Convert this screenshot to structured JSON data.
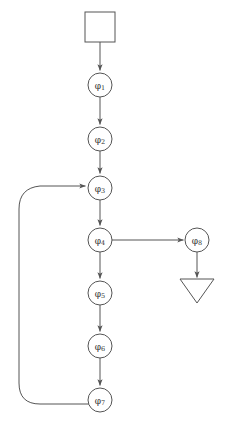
{
  "diagram": {
    "type": "flowchart",
    "background_color": "#ffffff",
    "stroke_color": "#555555",
    "label_color": "#333333",
    "nodes": [
      {
        "id": "start",
        "shape": "square",
        "label": "",
        "icon_name": "start-square-node",
        "x": 100,
        "y": 27,
        "size": 30
      },
      {
        "id": "phi1",
        "shape": "circle",
        "label": "φ",
        "subscript": "1",
        "icon_name": "state-circle-node",
        "x": 100,
        "y": 85,
        "r": 12
      },
      {
        "id": "phi2",
        "shape": "circle",
        "label": "φ",
        "subscript": "2",
        "icon_name": "state-circle-node",
        "x": 100,
        "y": 139,
        "r": 12
      },
      {
        "id": "phi3",
        "shape": "circle",
        "label": "φ",
        "subscript": "3",
        "icon_name": "state-circle-node",
        "x": 100,
        "y": 188,
        "r": 12
      },
      {
        "id": "phi4",
        "shape": "circle",
        "label": "φ",
        "subscript": "4",
        "icon_name": "state-circle-node",
        "x": 100,
        "y": 240,
        "r": 12
      },
      {
        "id": "phi5",
        "shape": "circle",
        "label": "φ",
        "subscript": "5",
        "icon_name": "state-circle-node",
        "x": 100,
        "y": 293,
        "r": 12
      },
      {
        "id": "phi6",
        "shape": "circle",
        "label": "φ",
        "subscript": "6",
        "icon_name": "state-circle-node",
        "x": 100,
        "y": 346,
        "r": 12
      },
      {
        "id": "phi7",
        "shape": "circle",
        "label": "φ",
        "subscript": "7",
        "icon_name": "state-circle-node",
        "x": 100,
        "y": 400,
        "r": 12
      },
      {
        "id": "phi8",
        "shape": "circle",
        "label": "φ",
        "subscript": "8",
        "icon_name": "state-circle-node",
        "x": 197,
        "y": 240,
        "r": 12
      },
      {
        "id": "end",
        "shape": "triangle-down",
        "label": "",
        "icon_name": "end-triangle-node",
        "x": 197,
        "y": 291,
        "width": 34,
        "height": 24
      }
    ],
    "edges": [
      {
        "id": "e-start-phi1",
        "from": "start",
        "to": "phi1",
        "kind": "straight-vertical",
        "arrow": true
      },
      {
        "id": "e-phi1-phi2",
        "from": "phi1",
        "to": "phi2",
        "kind": "straight-vertical",
        "arrow": true
      },
      {
        "id": "e-phi2-phi3",
        "from": "phi2",
        "to": "phi3",
        "kind": "straight-vertical",
        "arrow": true
      },
      {
        "id": "e-phi3-phi4",
        "from": "phi3",
        "to": "phi4",
        "kind": "straight-vertical",
        "arrow": true
      },
      {
        "id": "e-phi4-phi5",
        "from": "phi4",
        "to": "phi5",
        "kind": "straight-vertical",
        "arrow": true
      },
      {
        "id": "e-phi5-phi6",
        "from": "phi5",
        "to": "phi6",
        "kind": "straight-vertical",
        "arrow": true
      },
      {
        "id": "e-phi6-phi7",
        "from": "phi6",
        "to": "phi7",
        "kind": "straight-vertical",
        "arrow": true
      },
      {
        "id": "e-phi4-phi8",
        "from": "phi4",
        "to": "phi8",
        "kind": "straight-horizontal",
        "arrow": true
      },
      {
        "id": "e-phi8-end",
        "from": "phi8",
        "to": "end",
        "kind": "straight-vertical",
        "arrow": true
      },
      {
        "id": "e-phi7-phi3",
        "from": "phi7",
        "to": "phi3",
        "kind": "feedback-curve",
        "arrow": true
      }
    ],
    "caption": ""
  }
}
